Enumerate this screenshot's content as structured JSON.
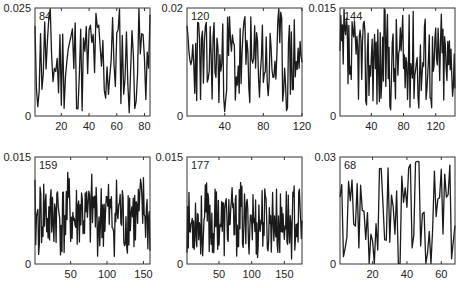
{
  "chart_data": {
    "type": "line",
    "layout": "2x3 grid of subplots",
    "series_note": "Each panel shows one jagged time series of n points. Individual y-values are not legible at this resolution and are not recorded here; the rendering script draws seeded placeholder lines instead.",
    "panels": [
      {
        "label": "84",
        "n": 84,
        "xlim": [
          1,
          84
        ],
        "ylim": [
          0,
          0.025
        ],
        "ytick_labels": [
          "0",
          "0.025"
        ],
        "xticks": [
          20,
          40,
          60,
          80
        ]
      },
      {
        "label": "120",
        "n": 120,
        "xlim": [
          1,
          120
        ],
        "ylim": [
          0,
          0.02
        ],
        "ytick_labels": [
          "0",
          "0.02"
        ],
        "xticks": [
          40,
          80,
          120
        ]
      },
      {
        "label": "144",
        "n": 144,
        "xlim": [
          1,
          144
        ],
        "ylim": [
          0,
          0.015
        ],
        "ytick_labels": [
          "0",
          "0.015"
        ],
        "xticks": [
          40,
          80,
          120
        ]
      },
      {
        "label": "159",
        "n": 159,
        "xlim": [
          1,
          159
        ],
        "ylim": [
          0,
          0.015
        ],
        "ytick_labels": [
          "0",
          "0.015"
        ],
        "xticks": [
          50,
          100,
          150
        ]
      },
      {
        "label": "177",
        "n": 177,
        "xlim": [
          1,
          177
        ],
        "ylim": [
          0,
          0.015
        ],
        "ytick_labels": [
          "0",
          "0.015"
        ],
        "xticks": [
          50,
          100,
          150
        ]
      },
      {
        "label": "68",
        "n": 68,
        "xlim": [
          1,
          68
        ],
        "ylim": [
          0,
          0.03
        ],
        "ytick_labels": [
          "0",
          "0.03"
        ],
        "xticks": [
          20,
          40,
          60
        ]
      }
    ],
    "title": "",
    "xlabel": "",
    "ylabel": "",
    "grid": false,
    "legend": "none"
  }
}
